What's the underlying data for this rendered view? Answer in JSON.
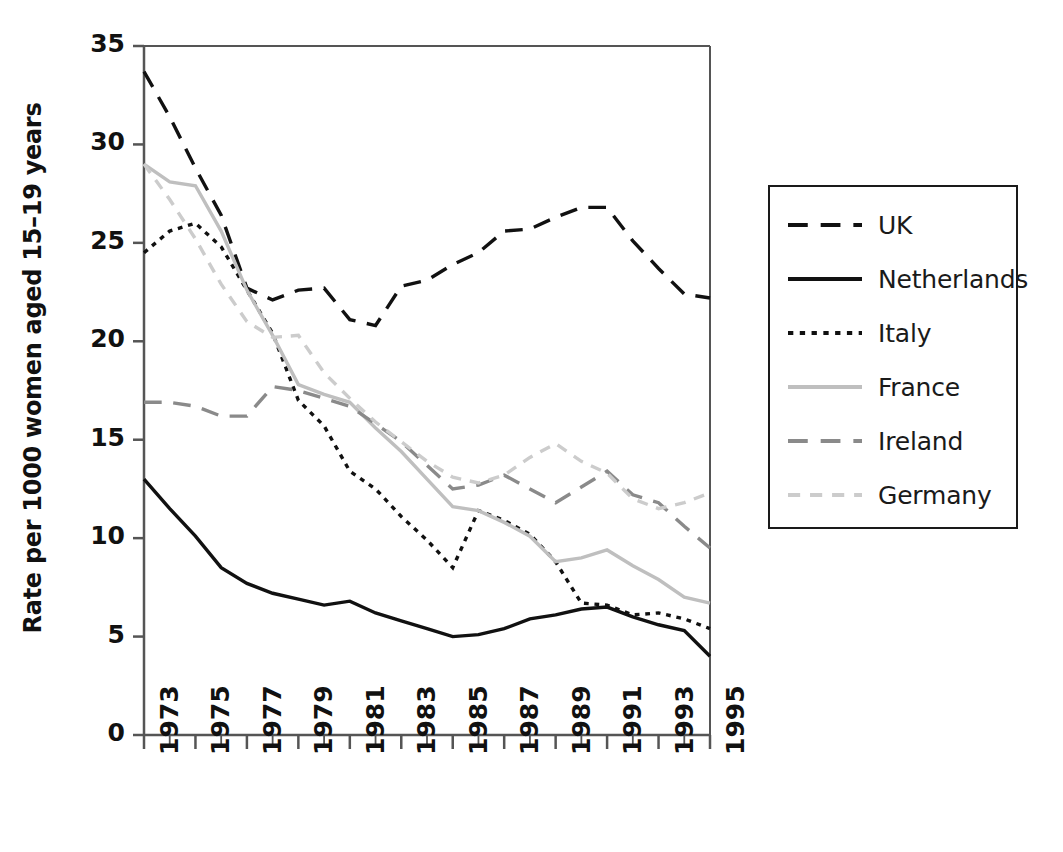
{
  "chart_data": {
    "type": "line",
    "title": "",
    "xlabel": "",
    "ylabel": "Rate per 1000 women aged 15–19 years",
    "xlim": [
      1973,
      1995
    ],
    "ylim": [
      0,
      35
    ],
    "ytick_values": [
      0,
      5,
      10,
      15,
      20,
      25,
      30,
      35
    ],
    "ytick_labels": [
      "0",
      "5",
      "10",
      "15",
      "20",
      "25",
      "30",
      "35"
    ],
    "xtick_values": [
      1973,
      1975,
      1977,
      1979,
      1981,
      1983,
      1985,
      1987,
      1989,
      1991,
      1993,
      1995
    ],
    "xtick_labels": [
      "1973",
      "1975",
      "1977",
      "1979",
      "1981",
      "1983",
      "1985",
      "1987",
      "1989",
      "1991",
      "1993",
      "1995"
    ],
    "minor_xticks_every": 1,
    "grid": false,
    "legend_position": "right-outside",
    "x": [
      1973,
      1974,
      1975,
      1976,
      1977,
      1978,
      1979,
      1980,
      1981,
      1982,
      1983,
      1984,
      1985,
      1986,
      1987,
      1988,
      1989,
      1990,
      1991,
      1992,
      1993,
      1994,
      1995
    ],
    "series": [
      {
        "name": "UK",
        "color": "#111111",
        "style": "dashed-long",
        "values": [
          33.7,
          31.4,
          28.8,
          26.4,
          22.7,
          22.1,
          22.6,
          22.7,
          21.1,
          20.8,
          22.8,
          23.1,
          23.9,
          24.5,
          25.6,
          25.7,
          26.3,
          26.8,
          26.8,
          25.1,
          23.7,
          22.4,
          22.2
        ]
      },
      {
        "name": "Netherlands",
        "color": "#111111",
        "style": "solid",
        "values": [
          13.0,
          11.5,
          10.1,
          8.5,
          7.7,
          7.2,
          6.9,
          6.6,
          6.8,
          6.2,
          5.8,
          5.4,
          5.0,
          5.1,
          5.4,
          5.9,
          6.1,
          6.4,
          6.5,
          6.0,
          5.6,
          5.3,
          4.0
        ]
      },
      {
        "name": "Italy",
        "color": "#111111",
        "style": "dotted",
        "values": [
          24.5,
          25.6,
          26.0,
          24.8,
          22.6,
          20.4,
          17.0,
          15.7,
          13.4,
          12.5,
          11.1,
          9.9,
          8.5,
          11.4,
          10.9,
          10.2,
          8.8,
          6.7,
          6.6,
          6.1,
          6.2,
          5.9,
          5.4
        ]
      },
      {
        "name": "France",
        "color": "#bfbfbf",
        "style": "solid",
        "values": [
          29.0,
          28.1,
          27.9,
          25.6,
          22.6,
          20.3,
          17.8,
          17.3,
          16.9,
          15.6,
          14.4,
          13.0,
          11.6,
          11.4,
          10.8,
          10.1,
          8.8,
          9.0,
          9.4,
          8.6,
          7.9,
          7.0,
          6.7
        ]
      },
      {
        "name": "Ireland",
        "color": "#8a8a8a",
        "style": "dashed-long",
        "values": [
          16.9,
          16.9,
          16.7,
          16.2,
          16.2,
          17.7,
          17.5,
          17.1,
          16.7,
          15.8,
          14.9,
          13.7,
          12.5,
          12.7,
          13.2,
          12.5,
          11.8,
          12.6,
          13.4,
          12.2,
          11.8,
          10.6,
          9.5
        ]
      },
      {
        "name": "Germany",
        "color": "#cccccc",
        "style": "dashed-short",
        "values": [
          29.0,
          27.2,
          25.2,
          22.9,
          21.0,
          20.2,
          20.3,
          18.4,
          17.1,
          15.9,
          14.9,
          13.9,
          13.1,
          12.8,
          13.2,
          14.1,
          14.8,
          13.9,
          13.3,
          12.0,
          11.5,
          11.8,
          12.3
        ]
      }
    ]
  },
  "legend": {
    "entries": [
      {
        "label": "UK"
      },
      {
        "label": "Netherlands"
      },
      {
        "label": "Italy"
      },
      {
        "label": "France"
      },
      {
        "label": "Ireland"
      },
      {
        "label": "Germany"
      }
    ]
  }
}
